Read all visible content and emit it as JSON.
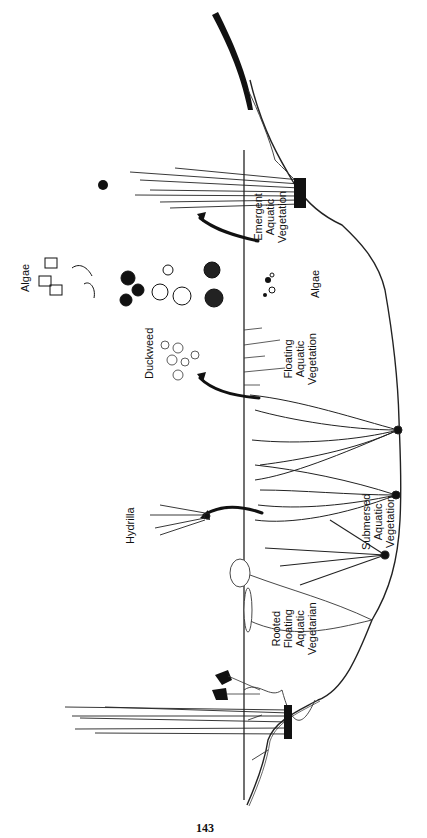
{
  "figure": {
    "orientation": "rotated-counterclockwise",
    "labels": {
      "emergent": [
        "Emergent",
        "Aquatic",
        "Vegetation"
      ],
      "algae_water": "Algae",
      "floating": [
        "Floating",
        "Aquatic",
        "Vegetation"
      ],
      "submersed": [
        "Submersed",
        "Aquatic",
        "Vegetation"
      ],
      "rooted_floating": [
        "Rooted",
        "Floating",
        "Aquatic",
        "Vegetarian"
      ],
      "algae_callout": "Algae",
      "duckweed_callout": "Duckweed",
      "hydrilla_callout": "Hydrilla"
    },
    "colors": {
      "ink": "#111111",
      "paper": "#ffffff"
    }
  },
  "page_number": "143"
}
